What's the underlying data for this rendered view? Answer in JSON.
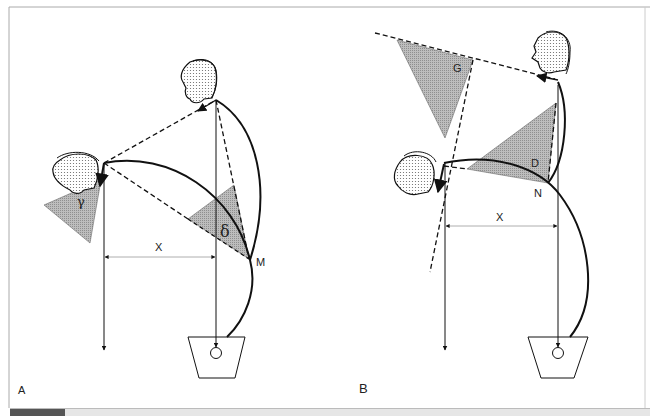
{
  "figure": {
    "panels": [
      {
        "id": "A",
        "panel_label": "A",
        "distance_label": "X",
        "point_label": "M",
        "angle_labels": {
          "left_triangle": "γ",
          "right_triangle": "δ"
        }
      },
      {
        "id": "B",
        "panel_label": "B",
        "distance_label": "X",
        "point_label": "N",
        "triangle_labels": {
          "upper_triangle": "G",
          "lower_triangle": "D"
        }
      }
    ],
    "colors": {
      "line": "#111111",
      "triangle_fill": "#b0b0b0",
      "frame": "#aaaaaa",
      "caption_bar_dark": "#555555",
      "caption_bar_light": "#e6e6e6"
    }
  }
}
